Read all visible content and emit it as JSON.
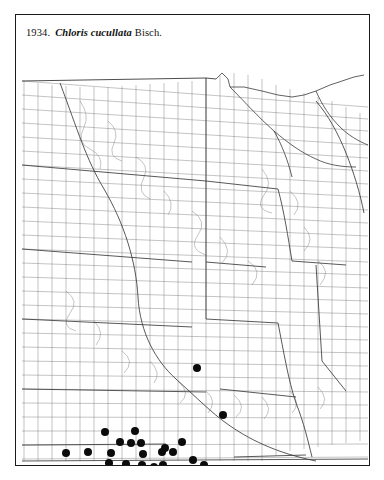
{
  "plate": {
    "number": "1934.",
    "species": "Chloris cucullata",
    "authority": "Bisch.",
    "caption_full": "1934.  Chloris cucullata Bisch."
  },
  "map": {
    "title": "county-level distribution map of the central United States",
    "region_description": "Great Plains and upper Midwest counties",
    "line_color": "#6e6e6e",
    "state_line_color": "#3a3a3a",
    "border_color": "#1a1a1a",
    "background_color": "#ffffff",
    "dot_color": "#0b0b0b",
    "dot_diameter_px": 8,
    "dot_count": 27,
    "legend": "filled circle = county record"
  },
  "chart_data": {
    "type": "scatter",
    "xlabel": "",
    "ylabel": "",
    "xlim": [
      0,
      355
    ],
    "ylim": [
      0,
      406
    ],
    "grid": false,
    "legend": "none",
    "series": [
      {
        "name": "county occurrence records",
        "marker": "filled-circle",
        "color": "#0b0b0b",
        "points": [
          {
            "x": 181,
            "y": 307
          },
          {
            "x": 207,
            "y": 354
          },
          {
            "x": 89,
            "y": 371
          },
          {
            "x": 50,
            "y": 392
          },
          {
            "x": 72,
            "y": 391
          },
          {
            "x": 95,
            "y": 392
          },
          {
            "x": 104,
            "y": 381
          },
          {
            "x": 115,
            "y": 382
          },
          {
            "x": 125,
            "y": 382
          },
          {
            "x": 127,
            "y": 384
          },
          {
            "x": 95,
            "y": 392
          },
          {
            "x": 128,
            "y": 393
          },
          {
            "x": 93,
            "y": 402
          },
          {
            "x": 126,
            "y": 404
          },
          {
            "x": 104,
            "y": 413
          },
          {
            "x": 122,
            "y": 413
          },
          {
            "x": 149,
            "y": 387
          },
          {
            "x": 157,
            "y": 391
          },
          {
            "x": 147,
            "y": 404
          },
          {
            "x": 138,
            "y": 406
          },
          {
            "x": 177,
            "y": 399
          },
          {
            "x": 188,
            "y": 404
          },
          {
            "x": 178,
            "y": 403
          },
          {
            "x": 146,
            "y": 391
          },
          {
            "x": 110,
            "y": 403
          },
          {
            "x": 119,
            "y": 370
          },
          {
            "x": 137,
            "y": 412
          }
        ]
      }
    ]
  },
  "dots": [
    {
      "id": "dot-1",
      "cx": 181,
      "cy": 307
    },
    {
      "id": "dot-2",
      "cx": 207,
      "cy": 354
    },
    {
      "id": "dot-3",
      "cx": 89,
      "cy": 371
    },
    {
      "id": "dot-4",
      "cx": 50,
      "cy": 392
    },
    {
      "id": "dot-5",
      "cx": 72,
      "cy": 391
    },
    {
      "id": "dot-6",
      "cx": 95,
      "cy": 392
    },
    {
      "id": "dot-7",
      "cx": 104,
      "cy": 381
    },
    {
      "id": "dot-8",
      "cx": 115,
      "cy": 382
    },
    {
      "id": "dot-9",
      "cx": 125,
      "cy": 382
    },
    {
      "id": "dot-10",
      "cx": 127,
      "cy": 393
    },
    {
      "id": "dot-11",
      "cx": 93,
      "cy": 402
    },
    {
      "id": "dot-12",
      "cx": 126,
      "cy": 404
    },
    {
      "id": "dot-13",
      "cx": 104,
      "cy": 413
    },
    {
      "id": "dot-14",
      "cx": 122,
      "cy": 413
    },
    {
      "id": "dot-15",
      "cx": 149,
      "cy": 387
    },
    {
      "id": "dot-16",
      "cx": 157,
      "cy": 391
    },
    {
      "id": "dot-17",
      "cx": 147,
      "cy": 404
    },
    {
      "id": "dot-18",
      "cx": 138,
      "cy": 406
    },
    {
      "id": "dot-19",
      "cx": 177,
      "cy": 399
    },
    {
      "id": "dot-20",
      "cx": 188,
      "cy": 404
    },
    {
      "id": "dot-21",
      "cx": 146,
      "cy": 391
    },
    {
      "id": "dot-22",
      "cx": 110,
      "cy": 403
    },
    {
      "id": "dot-23",
      "cx": 119,
      "cy": 370
    },
    {
      "id": "dot-24",
      "cx": 137,
      "cy": 412
    },
    {
      "id": "dot-25",
      "cx": 79,
      "cy": 413
    },
    {
      "id": "dot-26",
      "cx": 163,
      "cy": 412
    },
    {
      "id": "dot-27",
      "cx": 166,
      "cy": 381
    }
  ]
}
